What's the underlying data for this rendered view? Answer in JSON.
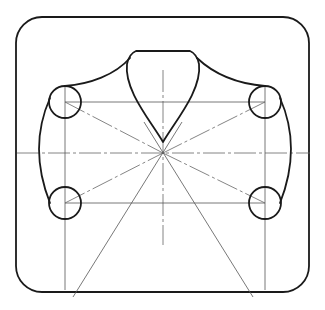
{
  "drawing": {
    "title": "",
    "kind": "technical-drawing",
    "description": "Engineering line drawing: rounded rectangular frame enclosing a symmetric cam-like profile with four corner circles, a V-shaped top lobe and construction lines radiating from a central point.",
    "elements": {
      "outer_frame": "rounded-rectangle",
      "circles": [
        "top-left",
        "top-right",
        "bottom-left",
        "bottom-right"
      ],
      "top_lobe": "V-shaped lobe with flat top",
      "construction_lines": [
        "horizontal-centerline",
        "vertical-centerline",
        "diagonal-top-left",
        "diagonal-top-right",
        "diagonal-bottom-left",
        "diagonal-bottom-right",
        "ray-down-left",
        "ray-down-right"
      ]
    },
    "colors": {
      "outline": "#1a1a1a",
      "construction": "#555555",
      "background": "#ffffff"
    }
  }
}
